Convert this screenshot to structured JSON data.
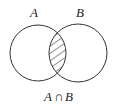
{
  "diagram": {
    "type": "venn",
    "sets": [
      {
        "name": "A",
        "label": "A"
      },
      {
        "name": "B",
        "label": "B"
      }
    ],
    "shaded_region": "intersection",
    "caption": {
      "left": "A",
      "op": "∩",
      "right": "B"
    },
    "colors": {
      "stroke": "#333333",
      "hatch": "#333333",
      "background": "#ffffff"
    }
  }
}
